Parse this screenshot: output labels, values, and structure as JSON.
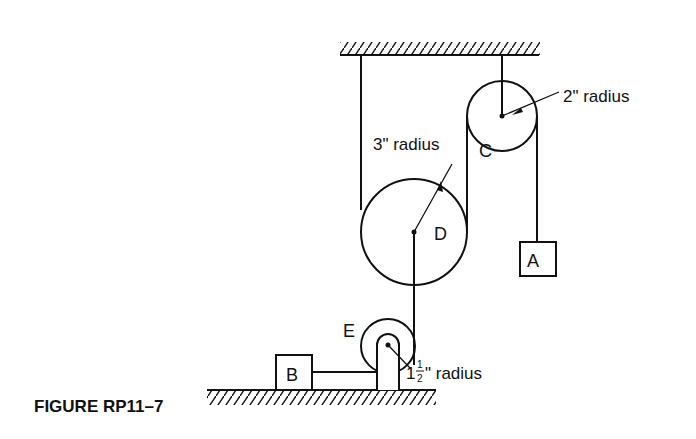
{
  "figure": {
    "caption": "FIGURE RP11–7",
    "labels": {
      "pulley_c": "C",
      "pulley_d": "D",
      "pulley_e": "E",
      "block_a": "A",
      "block_b": "B",
      "radius_c": "2\" radius",
      "radius_d": "3\" radius",
      "radius_e_whole": "1",
      "radius_e_num": "1",
      "radius_e_den": "2",
      "radius_e_suffix": "\" radius"
    }
  }
}
